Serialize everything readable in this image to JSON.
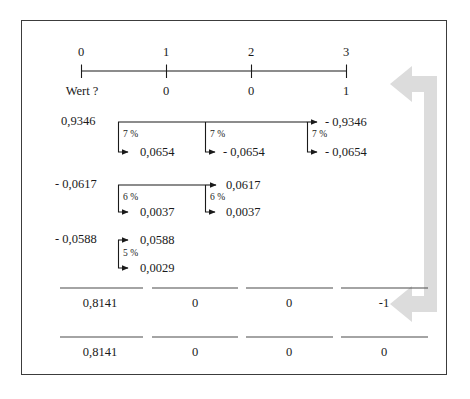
{
  "figure": {
    "title_present": false,
    "frame_color": "#3c3c3c",
    "background": "#ffffff",
    "text_color": "#1a1a1a",
    "arrow_color": "#d9d9d9"
  },
  "timeline": {
    "name": "period-axis",
    "ticks": [
      {
        "period": "0",
        "value": "Wert ?"
      },
      {
        "period": "1",
        "value": "0"
      },
      {
        "period": "2",
        "value": "0"
      },
      {
        "period": "3",
        "value": "1"
      }
    ]
  },
  "discount_rows": [
    {
      "id": "row-7-percent",
      "start_label": "0,9346",
      "rate": "7 %",
      "steps": [
        {
          "rate": "7 %",
          "top": "",
          "bottom": "0,0654"
        },
        {
          "rate": "7 %",
          "top": "",
          "bottom": "- 0,0654"
        },
        {
          "rate": "7 %",
          "top": "- 0,9346",
          "bottom": "- 0,0654"
        }
      ]
    },
    {
      "id": "row-6-percent",
      "start_label": "- 0,0617",
      "rate": "6 %",
      "steps": [
        {
          "rate": "6 %",
          "top": "",
          "bottom": "0,0037"
        },
        {
          "rate": "6 %",
          "top": "0,0617",
          "bottom": "0,0037"
        }
      ]
    },
    {
      "id": "row-5-percent",
      "start_label": "- 0,0588",
      "rate": "5 %",
      "steps": [
        {
          "rate": "5 %",
          "top": "0,0588",
          "bottom": "0,0029"
        }
      ]
    }
  ],
  "totals": {
    "subtotal_row": {
      "name": "subtotal-row",
      "cells": [
        "0,8141",
        "0",
        "0",
        "-1"
      ]
    },
    "total_row": {
      "name": "total-row",
      "cells": [
        "0,8141",
        "0",
        "0",
        "0"
      ]
    }
  },
  "labels": {
    "row1_start": "0,9346",
    "row1_pct_a": "7 %",
    "row1_pct_b": "7 %",
    "row1_pct_c": "7 %",
    "row1_b1": "0,0654",
    "row1_b2": "- 0,0654",
    "row1_b3": "- 0,0654",
    "row1_top3": "- 0,9346",
    "row2_start": "- 0,0617",
    "row2_pct_a": "6 %",
    "row2_pct_b": "6 %",
    "row2_b1": "0,0037",
    "row2_b2": "0,0037",
    "row2_top2": "0,0617",
    "row3_start": "- 0,0588",
    "row3_pct_a": "5 %",
    "row3_top1": "0,0588",
    "row3_b1": "0,0029",
    "axis_0": "0",
    "axis_1": "1",
    "axis_2": "2",
    "axis_3": "3",
    "val_0": "Wert ?",
    "val_1": "0",
    "val_2": "0",
    "val_3": "1",
    "sub_0": "0,8141",
    "sub_1": "0",
    "sub_2": "0",
    "sub_3": "-1",
    "tot_0": "0,8141",
    "tot_1": "0",
    "tot_2": "0",
    "tot_3": "0"
  }
}
